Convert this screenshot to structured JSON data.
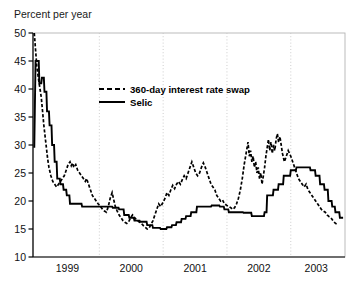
{
  "figure": {
    "axis_title": "Percent per year",
    "background_color": "#ffffff",
    "frame_color": "#b4b4b4",
    "grid_color": "#c8c8c8",
    "series_color": "#000000"
  },
  "legend": {
    "entries": [
      {
        "label": "360-day interest rate swap",
        "style": "dashed"
      },
      {
        "label": "Selic",
        "style": "solid"
      }
    ]
  },
  "axes": {
    "y_ticks": [
      "50",
      "45",
      "40",
      "35",
      "30",
      "25",
      "20",
      "15",
      "10"
    ],
    "x_ticks": [
      "1999",
      "2000",
      "2001",
      "2002",
      "2003"
    ]
  },
  "chart_data": {
    "type": "line",
    "title": "",
    "xlabel": "",
    "ylabel": "Percent per year",
    "ylim": [
      10,
      50
    ],
    "xlim": [
      1998.96,
      2003.85
    ],
    "grid": "vertical-dotted-at-year-boundaries",
    "legend_position": "upper-center-inset",
    "x_tick_labels": [
      "1999",
      "2000",
      "2001",
      "2002",
      "2003"
    ],
    "x_tick_positions": [
      1999.5,
      2000.5,
      2001.5,
      2002.5,
      2003.4
    ],
    "y_tick_values": [
      10,
      15,
      20,
      25,
      30,
      35,
      40,
      45,
      50
    ],
    "series": [
      {
        "name": "360-day interest rate swap",
        "style": "dashed",
        "color": "#000000",
        "points": [
          [
            1998.98,
            50.0
          ],
          [
            1999.02,
            44.0
          ],
          [
            1999.05,
            41.5
          ],
          [
            1999.07,
            40.0
          ],
          [
            1999.09,
            38.5
          ],
          [
            1999.11,
            36.0
          ],
          [
            1999.13,
            33.5
          ],
          [
            1999.15,
            31.5
          ],
          [
            1999.17,
            29.5
          ],
          [
            1999.19,
            27.5
          ],
          [
            1999.21,
            26.0
          ],
          [
            1999.24,
            24.5
          ],
          [
            1999.27,
            23.5
          ],
          [
            1999.3,
            23.0
          ],
          [
            1999.33,
            22.5
          ],
          [
            1999.36,
            23.0
          ],
          [
            1999.39,
            23.5
          ],
          [
            1999.42,
            24.0
          ],
          [
            1999.45,
            24.5
          ],
          [
            1999.48,
            25.5
          ],
          [
            1999.51,
            26.5
          ],
          [
            1999.54,
            27.0
          ],
          [
            1999.56,
            26.3
          ],
          [
            1999.58,
            26.8
          ],
          [
            1999.6,
            26.0
          ],
          [
            1999.63,
            26.5
          ],
          [
            1999.66,
            25.5
          ],
          [
            1999.69,
            25.0
          ],
          [
            1999.72,
            24.5
          ],
          [
            1999.75,
            24.0
          ],
          [
            1999.78,
            23.5
          ],
          [
            1999.8,
            24.0
          ],
          [
            1999.83,
            23.0
          ],
          [
            1999.86,
            22.0
          ],
          [
            1999.89,
            21.0
          ],
          [
            1999.92,
            20.5
          ],
          [
            1999.95,
            20.0
          ],
          [
            1999.98,
            19.5
          ],
          [
            2000.02,
            19.0
          ],
          [
            2000.05,
            18.5
          ],
          [
            2000.08,
            18.2
          ],
          [
            2000.11,
            18.0
          ],
          [
            2000.14,
            19.0
          ],
          [
            2000.17,
            20.5
          ],
          [
            2000.2,
            21.5
          ],
          [
            2000.22,
            20.5
          ],
          [
            2000.25,
            19.0
          ],
          [
            2000.28,
            18.2
          ],
          [
            2000.31,
            17.5
          ],
          [
            2000.34,
            17.0
          ],
          [
            2000.37,
            16.5
          ],
          [
            2000.4,
            16.2
          ],
          [
            2000.43,
            16.0
          ],
          [
            2000.46,
            16.3
          ],
          [
            2000.49,
            17.0
          ],
          [
            2000.52,
            17.5
          ],
          [
            2000.54,
            17.2
          ],
          [
            2000.57,
            16.8
          ],
          [
            2000.6,
            16.5
          ],
          [
            2000.63,
            16.2
          ],
          [
            2000.66,
            16.0
          ],
          [
            2000.69,
            15.6
          ],
          [
            2000.72,
            15.3
          ],
          [
            2000.75,
            15.0
          ],
          [
            2000.78,
            15.2
          ],
          [
            2000.81,
            15.8
          ],
          [
            2000.84,
            16.5
          ],
          [
            2000.87,
            17.5
          ],
          [
            2000.9,
            18.5
          ],
          [
            2000.93,
            19.5
          ],
          [
            2000.96,
            19.0
          ],
          [
            2001.0,
            19.8
          ],
          [
            2001.03,
            20.5
          ],
          [
            2001.06,
            21.5
          ],
          [
            2001.09,
            21.0
          ],
          [
            2001.12,
            22.0
          ],
          [
            2001.15,
            22.8
          ],
          [
            2001.18,
            22.2
          ],
          [
            2001.21,
            23.0
          ],
          [
            2001.24,
            23.5
          ],
          [
            2001.27,
            23.0
          ],
          [
            2001.3,
            23.8
          ],
          [
            2001.33,
            24.5
          ],
          [
            2001.36,
            24.0
          ],
          [
            2001.39,
            25.0
          ],
          [
            2001.42,
            26.0
          ],
          [
            2001.45,
            27.0
          ],
          [
            2001.48,
            26.0
          ],
          [
            2001.51,
            25.0
          ],
          [
            2001.54,
            24.5
          ],
          [
            2001.57,
            25.0
          ],
          [
            2001.6,
            26.0
          ],
          [
            2001.63,
            26.8
          ],
          [
            2001.66,
            26.0
          ],
          [
            2001.69,
            25.0
          ],
          [
            2001.72,
            24.0
          ],
          [
            2001.75,
            23.0
          ],
          [
            2001.78,
            22.5
          ],
          [
            2001.81,
            22.0
          ],
          [
            2001.84,
            21.0
          ],
          [
            2001.87,
            20.5
          ],
          [
            2001.9,
            20.0
          ],
          [
            2001.93,
            20.2
          ],
          [
            2001.96,
            19.5
          ],
          [
            2002.0,
            19.2
          ],
          [
            2002.03,
            19.0
          ],
          [
            2002.06,
            18.8
          ],
          [
            2002.09,
            18.5
          ],
          [
            2002.12,
            18.8
          ],
          [
            2002.15,
            19.5
          ],
          [
            2002.18,
            20.5
          ],
          [
            2002.21,
            22.0
          ],
          [
            2002.24,
            24.0
          ],
          [
            2002.27,
            26.5
          ],
          [
            2002.3,
            28.5
          ],
          [
            2002.33,
            30.5
          ],
          [
            2002.35,
            28.0
          ],
          [
            2002.37,
            29.0
          ],
          [
            2002.39,
            27.0
          ],
          [
            2002.41,
            28.0
          ],
          [
            2002.43,
            26.0
          ],
          [
            2002.45,
            27.0
          ],
          [
            2002.47,
            25.0
          ],
          [
            2002.49,
            26.0
          ],
          [
            2002.51,
            24.0
          ],
          [
            2002.53,
            25.0
          ],
          [
            2002.55,
            23.0
          ],
          [
            2002.57,
            24.5
          ],
          [
            2002.59,
            26.0
          ],
          [
            2002.61,
            28.0
          ],
          [
            2002.63,
            29.5
          ],
          [
            2002.65,
            31.0
          ],
          [
            2002.67,
            29.0
          ],
          [
            2002.69,
            30.5
          ],
          [
            2002.71,
            28.5
          ],
          [
            2002.73,
            30.0
          ],
          [
            2002.75,
            29.0
          ],
          [
            2002.77,
            31.0
          ],
          [
            2002.79,
            32.0
          ],
          [
            2002.81,
            30.5
          ],
          [
            2002.83,
            31.5
          ],
          [
            2002.85,
            30.0
          ],
          [
            2002.87,
            28.5
          ],
          [
            2002.9,
            27.0
          ],
          [
            2002.93,
            28.0
          ],
          [
            2002.96,
            29.0
          ],
          [
            2003.0,
            28.0
          ],
          [
            2003.03,
            27.0
          ],
          [
            2003.06,
            26.0
          ],
          [
            2003.09,
            25.0
          ],
          [
            2003.12,
            24.0
          ],
          [
            2003.15,
            23.5
          ],
          [
            2003.18,
            23.0
          ],
          [
            2003.21,
            22.5
          ],
          [
            2003.24,
            23.0
          ],
          [
            2003.27,
            22.0
          ],
          [
            2003.3,
            21.5
          ],
          [
            2003.33,
            21.0
          ],
          [
            2003.36,
            20.5
          ],
          [
            2003.39,
            20.0
          ],
          [
            2003.42,
            19.5
          ],
          [
            2003.45,
            19.0
          ],
          [
            2003.48,
            18.5
          ],
          [
            2003.51,
            18.2
          ],
          [
            2003.54,
            18.0
          ],
          [
            2003.57,
            17.5
          ],
          [
            2003.6,
            17.2
          ],
          [
            2003.63,
            17.0
          ],
          [
            2003.66,
            16.5
          ],
          [
            2003.7,
            16.0
          ],
          [
            2003.74,
            15.8
          ]
        ]
      },
      {
        "name": "Selic",
        "style": "solid-step",
        "color": "#000000",
        "points": [
          [
            1998.98,
            29.5
          ],
          [
            1999.0,
            45.0
          ],
          [
            1999.05,
            45.0
          ],
          [
            1999.06,
            41.0
          ],
          [
            1999.09,
            41.0
          ],
          [
            1999.1,
            42.0
          ],
          [
            1999.13,
            42.0
          ],
          [
            1999.14,
            39.5
          ],
          [
            1999.17,
            39.5
          ],
          [
            1999.18,
            36.0
          ],
          [
            1999.21,
            36.0
          ],
          [
            1999.22,
            33.5
          ],
          [
            1999.25,
            33.5
          ],
          [
            1999.26,
            30.0
          ],
          [
            1999.29,
            30.0
          ],
          [
            1999.3,
            27.0
          ],
          [
            1999.33,
            27.0
          ],
          [
            1999.34,
            24.0
          ],
          [
            1999.38,
            24.0
          ],
          [
            1999.39,
            23.0
          ],
          [
            1999.43,
            23.0
          ],
          [
            1999.44,
            22.0
          ],
          [
            1999.48,
            22.0
          ],
          [
            1999.49,
            21.0
          ],
          [
            1999.53,
            21.0
          ],
          [
            1999.54,
            19.5
          ],
          [
            1999.72,
            19.5
          ],
          [
            1999.73,
            19.0
          ],
          [
            2000.2,
            19.0
          ],
          [
            2000.21,
            18.8
          ],
          [
            2000.3,
            18.8
          ],
          [
            2000.31,
            18.5
          ],
          [
            2000.38,
            18.5
          ],
          [
            2000.39,
            17.5
          ],
          [
            2000.46,
            17.5
          ],
          [
            2000.47,
            17.0
          ],
          [
            2000.54,
            17.0
          ],
          [
            2000.55,
            16.5
          ],
          [
            2000.63,
            16.5
          ],
          [
            2000.64,
            16.3
          ],
          [
            2000.74,
            16.3
          ],
          [
            2000.75,
            15.7
          ],
          [
            2000.83,
            15.7
          ],
          [
            2000.84,
            15.2
          ],
          [
            2000.95,
            15.2
          ],
          [
            2000.96,
            15.0
          ],
          [
            2001.05,
            15.0
          ],
          [
            2001.06,
            15.3
          ],
          [
            2001.13,
            15.3
          ],
          [
            2001.14,
            15.7
          ],
          [
            2001.2,
            15.7
          ],
          [
            2001.21,
            16.2
          ],
          [
            2001.28,
            16.2
          ],
          [
            2001.29,
            16.8
          ],
          [
            2001.35,
            16.8
          ],
          [
            2001.36,
            17.3
          ],
          [
            2001.43,
            17.3
          ],
          [
            2001.44,
            18.0
          ],
          [
            2001.52,
            18.0
          ],
          [
            2001.53,
            19.0
          ],
          [
            2001.75,
            19.0
          ],
          [
            2001.76,
            19.2
          ],
          [
            2001.88,
            19.2
          ],
          [
            2001.89,
            19.0
          ],
          [
            2001.95,
            19.0
          ],
          [
            2001.96,
            18.5
          ],
          [
            2002.02,
            18.5
          ],
          [
            2002.03,
            18.0
          ],
          [
            2002.25,
            18.0
          ],
          [
            2002.26,
            17.9
          ],
          [
            2002.38,
            17.9
          ],
          [
            2002.39,
            17.3
          ],
          [
            2002.58,
            17.3
          ],
          [
            2002.59,
            18.0
          ],
          [
            2002.62,
            18.0
          ],
          [
            2002.63,
            21.0
          ],
          [
            2002.72,
            21.0
          ],
          [
            2002.73,
            22.0
          ],
          [
            2002.8,
            22.0
          ],
          [
            2002.81,
            23.0
          ],
          [
            2002.88,
            23.0
          ],
          [
            2002.89,
            24.5
          ],
          [
            2002.99,
            24.5
          ],
          [
            2003.0,
            25.5
          ],
          [
            2003.08,
            25.5
          ],
          [
            2003.09,
            26.0
          ],
          [
            2003.3,
            26.0
          ],
          [
            2003.31,
            25.5
          ],
          [
            2003.38,
            25.5
          ],
          [
            2003.39,
            24.5
          ],
          [
            2003.45,
            24.5
          ],
          [
            2003.46,
            23.0
          ],
          [
            2003.52,
            23.0
          ],
          [
            2003.53,
            22.0
          ],
          [
            2003.58,
            22.0
          ],
          [
            2003.59,
            20.0
          ],
          [
            2003.64,
            20.0
          ],
          [
            2003.65,
            19.0
          ],
          [
            2003.69,
            19.0
          ],
          [
            2003.7,
            18.0
          ],
          [
            2003.76,
            18.0
          ],
          [
            2003.77,
            17.0
          ],
          [
            2003.82,
            17.0
          ]
        ]
      }
    ]
  }
}
